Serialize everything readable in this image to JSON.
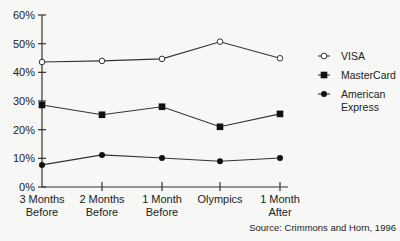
{
  "chart_data": {
    "type": "line",
    "title": "",
    "xlabel": "",
    "ylabel": "",
    "ylim": [
      0,
      60
    ],
    "yticks": [
      "0%",
      "10%",
      "20%",
      "30%",
      "40%",
      "50%",
      "60%"
    ],
    "categories": [
      [
        "3 Months",
        "Before"
      ],
      [
        "2 Months",
        "Before"
      ],
      [
        "1 Month",
        "Before"
      ],
      [
        "Olympics"
      ],
      [
        "1 Month",
        "After"
      ]
    ],
    "series": [
      {
        "name": "VISA",
        "marker": "open-circle",
        "values": [
          43.6,
          44.0,
          44.7,
          50.7,
          44.9
        ]
      },
      {
        "name": "MasterCard",
        "marker": "filled-square",
        "values": [
          28.6,
          25.2,
          28.0,
          21.0,
          25.5
        ]
      },
      {
        "name": "American Express",
        "legend_lines": [
          "American",
          "Express"
        ],
        "marker": "filled-circle",
        "values": [
          7.7,
          11.2,
          10.1,
          9.0,
          10.1
        ]
      }
    ],
    "grid": false,
    "legend_position": "right",
    "annotation": "Source: Crimmons and Horn, 1996"
  }
}
